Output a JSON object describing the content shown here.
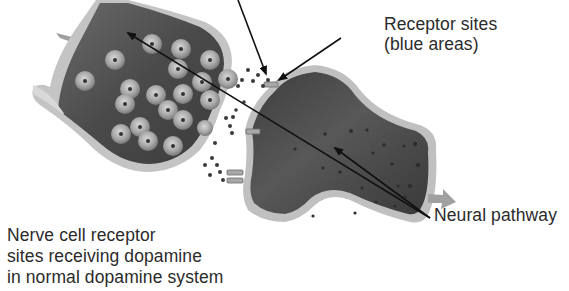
{
  "diagram": {
    "type": "biological-illustration",
    "colors": {
      "background": "#ffffff",
      "cell_interior": "#4a4a4a",
      "cell_membrane": "#b8b8b8",
      "vesicle": "#9a9a9a",
      "dopamine_dot": "#3a3a3a",
      "arrow": "#111111",
      "pathway_arrow": "#9c9c9c",
      "text": "#2b2b2b"
    },
    "labels": {
      "receptor_sites": {
        "line1": "Receptor sites",
        "line2": "(blue areas)"
      },
      "neural_pathway": "Neural pathway",
      "caption": {
        "line1": "Nerve cell receptor",
        "line2": "sites receiving dopamine",
        "line3": "in normal dopamine system"
      }
    },
    "elements": [
      {
        "name": "presynaptic-neuron",
        "position": "upper-left"
      },
      {
        "name": "postsynaptic-neuron",
        "position": "center-right"
      },
      {
        "name": "synaptic-vesicles",
        "count": 21
      },
      {
        "name": "dopamine-molecules",
        "location": "synaptic cleft"
      },
      {
        "name": "receptor-sites",
        "count": 4
      },
      {
        "name": "neural-pathway-arrow",
        "direction": "left-to-right"
      }
    ]
  }
}
